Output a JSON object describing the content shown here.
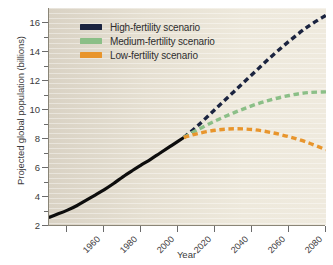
{
  "chart_data": {
    "type": "line",
    "title": "",
    "xlabel": "Year",
    "ylabel": "Projected global population (billions)",
    "xlim": [
      1950,
      2100
    ],
    "ylim": [
      2,
      17
    ],
    "xticks": [
      1960,
      1980,
      2000,
      2020,
      2040,
      2060,
      2080,
      2100
    ],
    "xticklabels": [
      "1960",
      "1980",
      "2000",
      "2020",
      "2040",
      "2060",
      "2080",
      "2100"
    ],
    "yticks": [
      2,
      4,
      6,
      8,
      10,
      12,
      14,
      16
    ],
    "yticklabels": [
      "2",
      "4",
      "6",
      "8",
      "10",
      "12",
      "14",
      "16"
    ],
    "yminorticks": [
      3,
      5,
      7,
      9,
      11,
      13,
      15
    ],
    "grid": false,
    "legend_position": "upper-left-inside",
    "colors": {
      "high": "#1b2440",
      "medium": "#8bbf87",
      "low": "#e8952c",
      "historical": "#0d0d0d",
      "plot_background": "#e3ddcf",
      "axis": "#8a8577",
      "text": "#3b3b3b"
    },
    "series": [
      {
        "name": "Historical",
        "style": "solid",
        "color": "#0d0d0d",
        "x": [
          1950,
          1955,
          1960,
          1965,
          1970,
          1975,
          1980,
          1985,
          1990,
          1995,
          2000,
          2005,
          2010,
          2015,
          2020,
          2023
        ],
        "values": [
          2.53,
          2.77,
          3.03,
          3.33,
          3.7,
          4.07,
          4.45,
          4.87,
          5.33,
          5.75,
          6.15,
          6.54,
          6.96,
          7.38,
          7.8,
          8.05
        ]
      },
      {
        "name": "High-fertility scenario",
        "style": "dashed",
        "color": "#1b2440",
        "x": [
          2023,
          2030,
          2040,
          2050,
          2060,
          2070,
          2080,
          2090,
          2100
        ],
        "values": [
          8.05,
          8.8,
          10.0,
          11.2,
          12.4,
          13.6,
          14.7,
          15.7,
          16.5
        ]
      },
      {
        "name": "Medium-fertility scenario",
        "style": "dashed",
        "color": "#8bbf87",
        "x": [
          2023,
          2030,
          2040,
          2050,
          2060,
          2070,
          2080,
          2090,
          2100
        ],
        "values": [
          8.05,
          8.55,
          9.2,
          9.75,
          10.25,
          10.65,
          10.95,
          11.15,
          11.2
        ]
      },
      {
        "name": "Low-fertility scenario",
        "style": "dashed",
        "color": "#e8952c",
        "x": [
          2023,
          2030,
          2040,
          2050,
          2060,
          2070,
          2080,
          2090,
          2100
        ],
        "values": [
          8.05,
          8.3,
          8.55,
          8.65,
          8.6,
          8.4,
          8.1,
          7.7,
          7.2
        ]
      }
    ]
  },
  "legend": {
    "items": [
      {
        "label": "High-fertility scenario",
        "color": "#1b2440",
        "key": "high"
      },
      {
        "label": "Medium-fertility scenario",
        "color": "#8bbf87",
        "key": "medium"
      },
      {
        "label": "Low-fertility scenario",
        "color": "#e8952c",
        "key": "low"
      }
    ]
  },
  "axes": {
    "x_title": "Year",
    "y_title": "Projected global population (billions)"
  }
}
